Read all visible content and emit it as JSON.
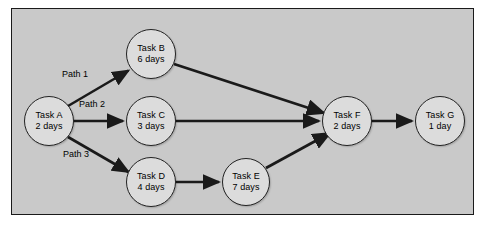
{
  "diagram": {
    "type": "network-diagram",
    "title": "",
    "background_color": "#c9c9c9",
    "page_background_color": "#ffffff",
    "border_color": "#1a1a1a",
    "node_fill_color": "#dcdcdc",
    "node_border_color": "#222222",
    "arrow_color": "#1a1a1a",
    "nodes": [
      {
        "id": "A",
        "name": "Task A",
        "duration": "2 days",
        "cx": 49,
        "cy": 121,
        "r": 25
      },
      {
        "id": "B",
        "name": "Task B",
        "duration": "6 days",
        "cx": 151,
        "cy": 54,
        "r": 25
      },
      {
        "id": "C",
        "name": "Task C",
        "duration": "3 days",
        "cx": 151,
        "cy": 121,
        "r": 25
      },
      {
        "id": "D",
        "name": "Task D",
        "duration": "4 days",
        "cx": 151,
        "cy": 182,
        "r": 25
      },
      {
        "id": "E",
        "name": "Task E",
        "duration": "7 days",
        "cx": 246,
        "cy": 182,
        "r": 24
      },
      {
        "id": "F",
        "name": "Task F",
        "duration": "2 days",
        "cx": 347,
        "cy": 121,
        "r": 25
      },
      {
        "id": "G",
        "name": "Task G",
        "duration": "1 day",
        "cx": 440,
        "cy": 121,
        "r": 25
      }
    ],
    "edges": [
      {
        "from": "A",
        "to": "B",
        "label": "Path 1"
      },
      {
        "from": "A",
        "to": "C",
        "label": "Path 2"
      },
      {
        "from": "A",
        "to": "D",
        "label": "Path 3"
      },
      {
        "from": "B",
        "to": "F",
        "label": ""
      },
      {
        "from": "C",
        "to": "F",
        "label": ""
      },
      {
        "from": "D",
        "to": "E",
        "label": ""
      },
      {
        "from": "E",
        "to": "F",
        "label": ""
      },
      {
        "from": "F",
        "to": "G",
        "label": ""
      }
    ],
    "path_labels": [
      {
        "text": "Path 1",
        "x": 62,
        "y": 69
      },
      {
        "text": "Path 2",
        "x": 79,
        "y": 99
      },
      {
        "text": "Path 3",
        "x": 63,
        "y": 149
      }
    ]
  }
}
